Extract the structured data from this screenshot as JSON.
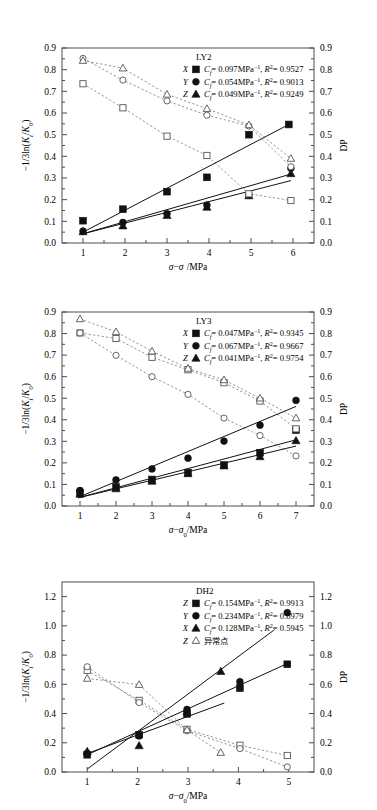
{
  "figure": {
    "type": "multi-panel-scatter-line",
    "panel_count": 3,
    "axis": {
      "xlabel": "σ − σ₀/MPa",
      "ylabel_left": "−1/3ln(Kᵢ/K₀)",
      "ylabel_right": "DP"
    }
  },
  "chart_data": [
    {
      "type": "scatter",
      "title": "LY2",
      "xlabel": "σ − σ₀/MPa",
      "ylabel": "−1/3ln(Kᵢ/K₀)",
      "ylabel_right": "DP",
      "xlim": [
        0.5,
        6.5
      ],
      "ylim": [
        0.0,
        0.9
      ],
      "ylim_right": [
        0.0,
        0.9
      ],
      "xticks": [
        1,
        2,
        3,
        4,
        5,
        6
      ],
      "yticks": [
        0.0,
        0.1,
        0.2,
        0.3,
        0.4,
        0.5,
        0.6,
        0.7,
        0.8,
        0.9
      ],
      "yticks_right": [
        0.0,
        0.1,
        0.2,
        0.3,
        0.4,
        0.5,
        0.6,
        0.7,
        0.8,
        0.9
      ],
      "grid": false,
      "legend_position": "top-right",
      "legend": [
        {
          "label": "X",
          "marker": "square-filled",
          "text": "Cf = 0.097MPa⁻¹, R² = 0.9527",
          "cf": 0.097,
          "r2": 0.9527
        },
        {
          "label": "Y",
          "marker": "circle-filled",
          "text": "Cf = 0.054MPa⁻¹, R² = 0.9013",
          "cf": 0.054,
          "r2": 0.9013
        },
        {
          "label": "Z",
          "marker": "triangle-filled",
          "text": "Cf = 0.049MPa⁻¹, R² = 0.9249",
          "cf": 0.049,
          "r2": 0.9249
        }
      ],
      "series": [
        {
          "name": "X",
          "marker": "square-filled",
          "style": "solid-fit",
          "x": [
            1.0,
            1.95,
            3.0,
            3.95,
            4.95,
            5.9
          ],
          "values": [
            0.103,
            0.156,
            0.237,
            0.303,
            0.5,
            0.547
          ]
        },
        {
          "name": "Y",
          "marker": "circle-filled",
          "style": "solid-fit",
          "x": [
            1.0,
            1.95,
            3.0,
            3.95,
            4.95,
            5.95
          ],
          "values": [
            0.055,
            0.095,
            0.135,
            0.175,
            0.222,
            0.345
          ]
        },
        {
          "name": "Z",
          "marker": "triangle-filled",
          "style": "solid-fit",
          "x": [
            1.0,
            1.95,
            3.0,
            3.95,
            4.95,
            5.95
          ],
          "values": [
            0.052,
            0.079,
            0.127,
            0.165,
            0.218,
            0.32
          ]
        },
        {
          "name": "X-DP",
          "marker": "square-hollow",
          "style": "dashed",
          "x": [
            1.0,
            1.95,
            3.0,
            3.95,
            4.95,
            5.95
          ],
          "values": [
            0.735,
            0.624,
            0.493,
            0.404,
            0.227,
            0.196
          ]
        },
        {
          "name": "Y-DP",
          "marker": "circle-hollow",
          "style": "dashed",
          "x": [
            1.0,
            1.95,
            3.0,
            3.95,
            4.95,
            5.95
          ],
          "values": [
            0.852,
            0.752,
            0.656,
            0.59,
            0.54,
            0.352
          ]
        },
        {
          "name": "Z-DP",
          "marker": "triangle-hollow",
          "style": "dashed",
          "x": [
            1.0,
            1.95,
            3.0,
            3.95,
            4.95,
            5.95
          ],
          "values": [
            0.842,
            0.807,
            0.686,
            0.62,
            0.545,
            0.39
          ]
        }
      ],
      "fits": [
        {
          "name": "X",
          "x0": 0.95,
          "y0": 0.045,
          "x1": 5.95,
          "y1": 0.552
        },
        {
          "name": "Y",
          "x0": 0.95,
          "y0": 0.04,
          "x1": 5.95,
          "y1": 0.318
        },
        {
          "name": "Z",
          "x0": 0.95,
          "y0": 0.04,
          "x1": 5.95,
          "y1": 0.288
        }
      ]
    },
    {
      "type": "scatter",
      "title": "LY3",
      "xlabel": "σ − σ₀/MPa",
      "ylabel": "−1/3ln(Kᵢ/K₀)",
      "ylabel_right": "DP",
      "xlim": [
        0.5,
        7.5
      ],
      "ylim": [
        0.0,
        0.9
      ],
      "ylim_right": [
        0.0,
        0.9
      ],
      "xticks": [
        1,
        2,
        3,
        4,
        5,
        6,
        7
      ],
      "yticks": [
        0.0,
        0.1,
        0.2,
        0.3,
        0.4,
        0.5,
        0.6,
        0.7,
        0.8,
        0.9
      ],
      "yticks_right": [
        0.0,
        0.1,
        0.2,
        0.3,
        0.4,
        0.5,
        0.6,
        0.7,
        0.8,
        0.9
      ],
      "grid": false,
      "legend_position": "top-right",
      "legend": [
        {
          "label": "X",
          "marker": "square-filled",
          "text": "Cf = 0.047MPa⁻¹, R² = 0.9345",
          "cf": 0.047,
          "r2": 0.9345
        },
        {
          "label": "Y",
          "marker": "circle-filled",
          "text": "Cf = 0.067MPa⁻¹, R² = 0.9667",
          "cf": 0.067,
          "r2": 0.9667
        },
        {
          "label": "Z",
          "marker": "triangle-filled",
          "text": "Cf = 0.041MPa⁻¹, R² = 0.9754",
          "cf": 0.041,
          "r2": 0.9754
        }
      ],
      "series": [
        {
          "name": "X",
          "marker": "square-filled",
          "style": "solid-fit",
          "x": [
            1.0,
            2.0,
            3.0,
            4.0,
            5.0,
            6.0,
            7.0
          ],
          "values": [
            0.06,
            0.088,
            0.123,
            0.155,
            0.19,
            0.247,
            0.352
          ]
        },
        {
          "name": "Y",
          "marker": "circle-filled",
          "style": "solid-fit",
          "x": [
            1.0,
            2.0,
            3.0,
            4.0,
            5.0,
            6.0,
            7.0
          ],
          "values": [
            0.072,
            0.121,
            0.172,
            0.222,
            0.301,
            0.375,
            0.49
          ]
        },
        {
          "name": "Z",
          "marker": "triangle-filled",
          "style": "solid-fit",
          "x": [
            1.0,
            2.0,
            3.0,
            4.0,
            5.0,
            6.0,
            7.0
          ],
          "values": [
            0.055,
            0.08,
            0.115,
            0.15,
            0.186,
            0.229,
            0.303
          ]
        },
        {
          "name": "X-DP",
          "marker": "square-hollow",
          "style": "dashed",
          "x": [
            1.0,
            2.0,
            3.0,
            4.0,
            5.0,
            6.0,
            7.0
          ],
          "values": [
            0.803,
            0.777,
            0.69,
            0.632,
            0.572,
            0.487,
            0.358
          ]
        },
        {
          "name": "Y-DP",
          "marker": "circle-hollow",
          "style": "dashed",
          "x": [
            1.0,
            2.0,
            3.0,
            4.0,
            5.0,
            6.0,
            7.0
          ],
          "values": [
            0.803,
            0.699,
            0.6,
            0.518,
            0.408,
            0.327,
            0.232
          ]
        },
        {
          "name": "Z-DP",
          "marker": "triangle-hollow",
          "style": "dashed",
          "x": [
            1.0,
            2.0,
            3.0,
            4.0,
            5.0,
            6.0,
            7.0
          ],
          "values": [
            0.868,
            0.808,
            0.718,
            0.638,
            0.585,
            0.5,
            0.408
          ]
        }
      ],
      "fits": [
        {
          "name": "X",
          "x0": 0.95,
          "y0": 0.038,
          "x1": 7.0,
          "y1": 0.307
        },
        {
          "name": "Y",
          "x0": 0.95,
          "y0": 0.04,
          "x1": 7.0,
          "y1": 0.462
        },
        {
          "name": "Z",
          "x0": 0.95,
          "y0": 0.038,
          "x1": 7.0,
          "y1": 0.278
        }
      ]
    },
    {
      "type": "scatter",
      "title": "DH2",
      "xlabel": "σ − σ₀/MPa",
      "ylabel": "−1/3ln(Kᵢ/K₀)",
      "ylabel_right": "DP",
      "xlim": [
        0.5,
        5.5
      ],
      "ylim": [
        0.0,
        1.3
      ],
      "ylim_right": [
        0.0,
        1.3
      ],
      "xticks": [
        1,
        2,
        3,
        4,
        5
      ],
      "yticks": [
        0.0,
        0.2,
        0.4,
        0.6,
        0.8,
        1.0,
        1.2
      ],
      "yticks_right": [
        0.0,
        0.2,
        0.4,
        0.6,
        0.8,
        1.0,
        1.2
      ],
      "grid": false,
      "legend_position": "top-right",
      "legend": [
        {
          "label": "Z",
          "marker": "square-filled",
          "text": "Cf = 0.154MPa⁻¹, R² = 0.9913",
          "cf": 0.154,
          "r2": 0.9913
        },
        {
          "label": "Y",
          "marker": "circle-filled",
          "text": "Cf = 0.234MPa⁻¹, R² = 0.8979",
          "cf": 0.234,
          "r2": 0.8979
        },
        {
          "label": "X",
          "marker": "triangle-filled",
          "text": "Cf = 0.128MPa⁻¹, R² = 0.5945",
          "cf": 0.128,
          "r2": 0.5945
        },
        {
          "label": "Z",
          "marker": "triangle-grey",
          "text": "异常点",
          "cn": true
        }
      ],
      "series": [
        {
          "name": "Z",
          "marker": "square-filled",
          "style": "solid-fit",
          "x": [
            1.0,
            2.03,
            2.98,
            4.03,
            4.97
          ],
          "values": [
            0.118,
            0.255,
            0.398,
            0.574,
            0.737
          ]
        },
        {
          "name": "Y",
          "marker": "circle-filled",
          "style": "solid-fit",
          "x": [
            1.0,
            2.03,
            2.98,
            4.03,
            4.97
          ],
          "values": [
            0.128,
            0.247,
            0.428,
            0.618,
            1.09
          ]
        },
        {
          "name": "X",
          "marker": "triangle-filled",
          "style": "solid-fit",
          "x": [
            1.0,
            2.03,
            2.98,
            3.65
          ],
          "values": [
            0.14,
            0.18,
            0.413,
            0.688
          ]
        },
        {
          "name": "Z-DP",
          "marker": "square-hollow",
          "style": "dashed",
          "x": [
            1.0,
            2.03,
            2.98,
            4.03,
            4.97
          ],
          "values": [
            0.695,
            0.49,
            0.292,
            0.183,
            0.113
          ]
        },
        {
          "name": "Y-DP",
          "marker": "circle-hollow",
          "style": "dashed",
          "x": [
            1.0,
            2.03,
            2.98,
            4.03,
            4.97
          ],
          "values": [
            0.72,
            0.475,
            0.282,
            0.16,
            0.035
          ]
        },
        {
          "name": "X-DP",
          "marker": "triangle-hollow",
          "style": "dashed",
          "x": [
            1.0,
            2.03,
            2.98,
            3.65
          ],
          "values": [
            0.64,
            0.598,
            0.288,
            0.133
          ]
        }
      ],
      "fits": [
        {
          "name": "Z",
          "x0": 0.95,
          "y0": 0.11,
          "x1": 4.97,
          "y1": 0.742
        },
        {
          "name": "Y",
          "x0": 1.0,
          "y0": 0.02,
          "x1": 4.72,
          "y1": 0.975
        },
        {
          "name": "X",
          "x0": 0.95,
          "y0": 0.12,
          "x1": 3.72,
          "y1": 0.472
        }
      ]
    }
  ]
}
